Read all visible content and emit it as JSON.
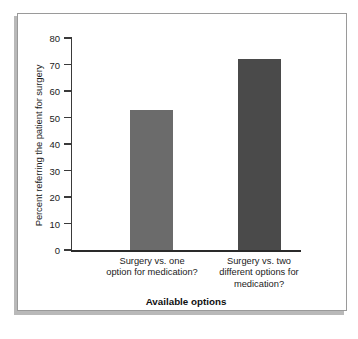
{
  "chart_data": {
    "type": "bar",
    "title": "",
    "xlabel": "Available options",
    "ylabel": "Percent referring the patient for surgery",
    "categories": [
      "Surgery vs. one option for medication?",
      "Surgery vs. two different options for medication?"
    ],
    "category_lines": [
      [
        "Surgery vs. one",
        "option for medication?"
      ],
      [
        "Surgery vs. two",
        "different options for",
        "medication?"
      ]
    ],
    "values": [
      53,
      72
    ],
    "ylim": [
      0,
      80
    ],
    "yticks": [
      0,
      10,
      20,
      30,
      40,
      50,
      60,
      70,
      80
    ],
    "ytick_labels": [
      "0",
      "10",
      "20",
      "30",
      "40",
      "50",
      "60",
      "70",
      "80"
    ],
    "grid": false,
    "legend": false,
    "bar_colors": [
      "#6b6b6b",
      "#4a4a4a"
    ]
  },
  "colors": {
    "bar_one": "#6b6b6b",
    "bar_two": "#4a4a4a",
    "axis": "#2a2a2a",
    "frame_border": "#9a9a9a",
    "frame_shadow": "#b9b9b9",
    "text": "#1b1b1b",
    "background": "#ffffff"
  }
}
